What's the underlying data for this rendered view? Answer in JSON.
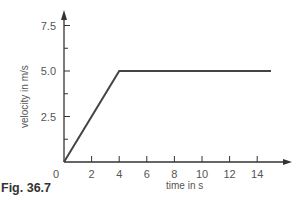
{
  "figure": {
    "caption": "Fig. 36.7"
  },
  "colors": {
    "axis": "#333333",
    "line": "#444444",
    "text": "#555555"
  },
  "chart_data": {
    "type": "line",
    "title": "",
    "xlabel": "time in s",
    "ylabel": "velocity in m/s",
    "xlim": [
      0,
      15.5
    ],
    "ylim": [
      0,
      8.5
    ],
    "x_ticks": [
      0,
      2,
      4,
      6,
      8,
      10,
      12,
      14
    ],
    "x_tick_labels": [
      "0",
      "2",
      "4",
      "6",
      "8",
      "10",
      "12",
      "14"
    ],
    "y_ticks": [
      2.5,
      5.0,
      7.5
    ],
    "y_tick_labels": [
      "2.5",
      "5.0",
      "7.5"
    ],
    "y_minor_ticks": [
      1.25,
      3.75,
      6.25
    ],
    "grid": false,
    "legend": null,
    "series": [
      {
        "name": "velocity",
        "x": [
          0,
          4,
          15
        ],
        "y": [
          0,
          5.0,
          5.0
        ]
      }
    ]
  }
}
